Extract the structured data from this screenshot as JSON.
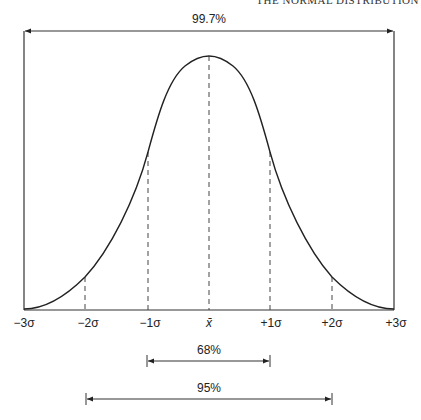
{
  "header": {
    "running_title": "THE NORMAL DISTRIBUTION"
  },
  "figure": {
    "type": "normal-distribution-diagram",
    "line_color": "#222222",
    "x_axis_labels": [
      {
        "text": "−3σ",
        "x": 36
      },
      {
        "text": "−2σ",
        "x": 98
      },
      {
        "text": "−1σ",
        "x": 160
      },
      {
        "text": "x̄",
        "x": 209
      },
      {
        "text": "+1σ",
        "x": 271
      },
      {
        "text": "+2σ",
        "x": 333
      },
      {
        "text": "+3σ",
        "x": 395
      }
    ],
    "spans": [
      {
        "label": "99.7%",
        "from": "-3σ",
        "to": "+3σ"
      },
      {
        "label": "68%",
        "from": "-1σ",
        "to": "+1σ"
      },
      {
        "label": "95%",
        "from": "-2σ",
        "to": "+2σ"
      }
    ]
  }
}
